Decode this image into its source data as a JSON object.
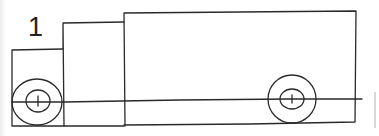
{
  "figure": {
    "label": "1",
    "parts": [
      "cab",
      "cab-roof-section",
      "cargo-box",
      "front-wheel",
      "rear-wheel",
      "axle-line"
    ],
    "stroke_color": "#2a2a2a",
    "background_color": "#ffffff"
  }
}
